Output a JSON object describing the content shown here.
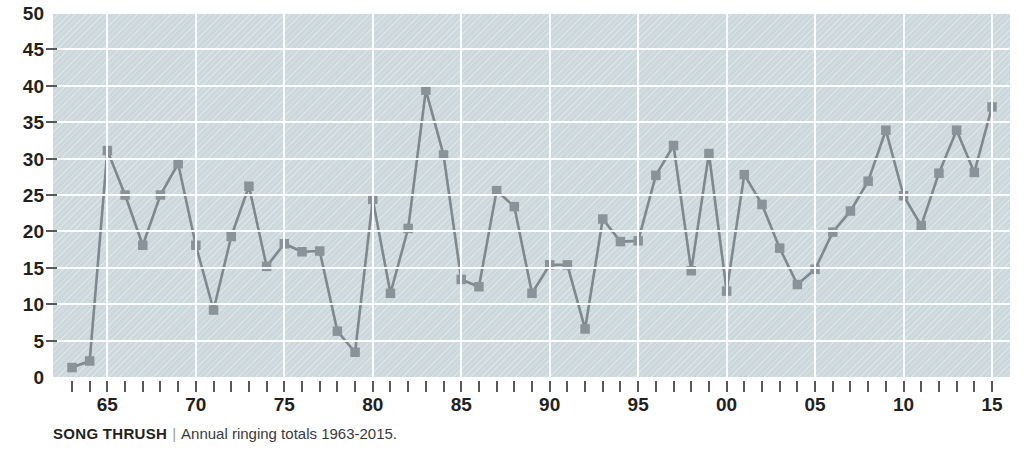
{
  "caption": {
    "species": "SONG THRUSH",
    "separator": "|",
    "description": "Annual ringing totals 1963-2015."
  },
  "colors": {
    "plot_background": "#ccd8dc",
    "gridline": "#ffffff",
    "line": "#7f888e",
    "marker": "#8a9399",
    "text": "#231f20",
    "tick": "#55595c"
  },
  "chart_data": {
    "type": "line",
    "xlabel": "",
    "ylabel": "",
    "xlim": [
      1963,
      2015
    ],
    "ylim": [
      0,
      50
    ],
    "grid": true,
    "legend": null,
    "y_ticks": [
      0,
      5,
      10,
      15,
      20,
      25,
      30,
      35,
      40,
      45,
      50
    ],
    "y_tick_labels": [
      "0",
      "5",
      "10",
      "15",
      "20",
      "25",
      "30",
      "35",
      "40",
      "45",
      "50"
    ],
    "x_tick_years": [
      1963,
      1964,
      1965,
      1966,
      1967,
      1968,
      1969,
      1970,
      1971,
      1972,
      1973,
      1974,
      1975,
      1976,
      1977,
      1978,
      1979,
      1980,
      1981,
      1982,
      1983,
      1984,
      1985,
      1986,
      1987,
      1988,
      1989,
      1990,
      1991,
      1992,
      1993,
      1994,
      1995,
      1996,
      1997,
      1998,
      1999,
      2000,
      2001,
      2002,
      2003,
      2004,
      2005,
      2006,
      2007,
      2008,
      2009,
      2010,
      2011,
      2012,
      2013,
      2014,
      2015
    ],
    "x_labelled_years": [
      1965,
      1970,
      1975,
      1980,
      1985,
      1990,
      1995,
      2000,
      2005,
      2010,
      2015
    ],
    "x_tick_labels": [
      "65",
      "70",
      "75",
      "80",
      "85",
      "90",
      "95",
      "00",
      "05",
      "10",
      "15"
    ],
    "x": [
      1963,
      1964,
      1965,
      1966,
      1967,
      1968,
      1969,
      1970,
      1971,
      1972,
      1973,
      1974,
      1975,
      1976,
      1977,
      1978,
      1979,
      1980,
      1981,
      1982,
      1983,
      1984,
      1985,
      1986,
      1987,
      1988,
      1989,
      1990,
      1991,
      1992,
      1993,
      1994,
      1995,
      1996,
      1997,
      1998,
      1999,
      2000,
      2001,
      2002,
      2003,
      2004,
      2005,
      2006,
      2007,
      2008,
      2009,
      2010,
      2011,
      2012,
      2013,
      2014,
      2015
    ],
    "values": [
      1.3,
      2.2,
      31.1,
      25.0,
      18.1,
      25.0,
      29.3,
      18.1,
      9.2,
      19.3,
      26.2,
      15.2,
      18.3,
      17.2,
      17.3,
      6.3,
      3.4,
      24.4,
      11.5,
      20.4,
      39.4,
      30.5,
      13.4,
      12.4,
      25.6,
      23.4,
      11.5,
      15.4,
      15.4,
      6.6,
      21.7,
      18.6,
      18.7,
      27.7,
      31.8,
      14.6,
      30.7,
      11.8,
      27.8,
      23.7,
      17.7,
      12.7,
      14.8,
      19.9,
      22.8,
      26.9,
      33.9,
      24.9,
      20.8,
      28.0,
      33.9,
      28.1,
      37.1
    ],
    "units": "ringing totals"
  }
}
